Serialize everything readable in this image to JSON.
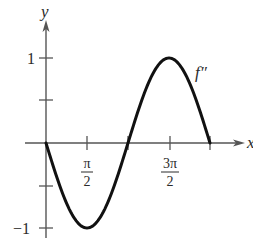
{
  "chart_data": {
    "type": "line",
    "title": "",
    "function_label": "f″",
    "xlabel": "x",
    "ylabel": "y",
    "x_ticks": [
      {
        "value": 1.5708,
        "label_num": "π",
        "label_den": "2"
      },
      {
        "value": 3.1416,
        "label_num": "",
        "label_den": ""
      },
      {
        "value": 4.7124,
        "label_num": "3π",
        "label_den": "2"
      },
      {
        "value": 6.2832,
        "label_num": "",
        "label_den": ""
      }
    ],
    "y_ticks": [
      {
        "value": 1,
        "label": "1"
      },
      {
        "value": 0.5,
        "label": ""
      },
      {
        "value": -0.5,
        "label": ""
      },
      {
        "value": -1,
        "label": "−1"
      }
    ],
    "xlim": [
      0,
      6.2832
    ],
    "ylim": [
      -1,
      1
    ],
    "series": [
      {
        "name": "f″",
        "expression": "-sin(x)",
        "x": [
          0,
          0.7854,
          1.5708,
          2.3562,
          3.1416,
          3.927,
          4.7124,
          5.4978,
          6.2832
        ],
        "y": [
          0,
          -0.707,
          -1,
          -0.707,
          0,
          0.707,
          1,
          0.707,
          0
        ]
      }
    ],
    "grid": false,
    "legend": "none"
  },
  "labels": {
    "y_axis": "y",
    "x_axis": "x",
    "curve": "f″",
    "tick_pi_half_num": "π",
    "tick_pi_half_den": "2",
    "tick_3pi_half_num": "3π",
    "tick_3pi_half_den": "2",
    "y_one": "1",
    "y_neg_one": "−1"
  },
  "colors": {
    "axis": "#555555",
    "curve": "#111111",
    "text": "#2a2a2a"
  }
}
